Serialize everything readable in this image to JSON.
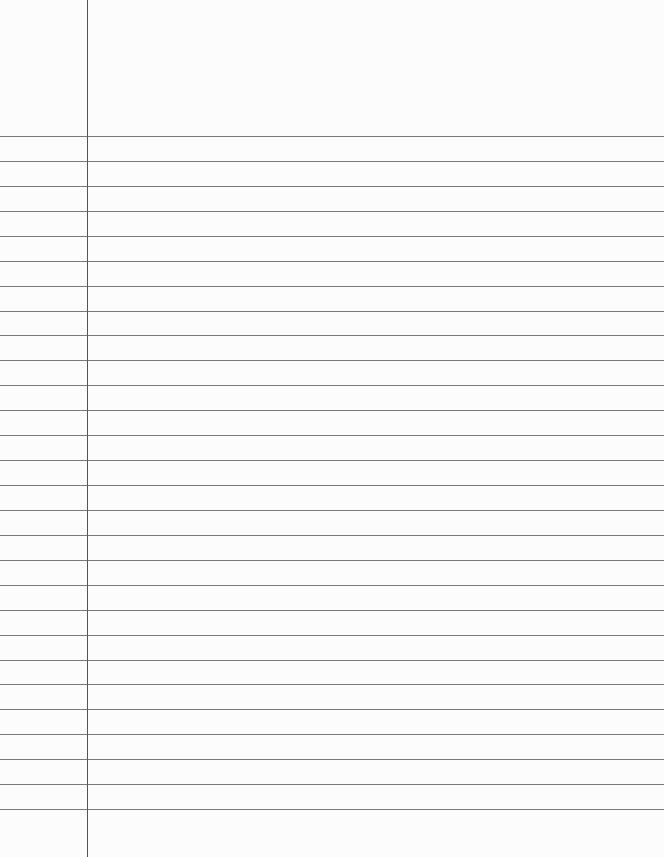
{
  "page": {
    "type": "lined-paper",
    "background_color": "#fcfcfc",
    "rule_color": "#7a7a7a",
    "margin_color": "#555555",
    "margin_x": 87,
    "first_rule_y": 136,
    "rule_spacing": 24.93,
    "rule_count": 28
  }
}
